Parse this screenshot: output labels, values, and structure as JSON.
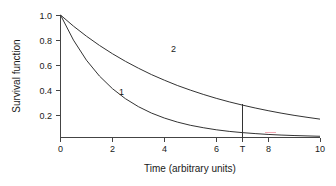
{
  "chart_data": {
    "type": "line",
    "title": "",
    "xlabel": "Time (arbitrary units)",
    "ylabel": "Survival function",
    "xlim": [
      0,
      10
    ],
    "ylim": [
      0,
      1.0
    ],
    "xticks": [
      0,
      2,
      4,
      6,
      8,
      10
    ],
    "xtick_labels": [
      "0",
      "2",
      "4",
      "6",
      "8",
      "10"
    ],
    "yticks": [
      0.2,
      0.4,
      0.6,
      0.8,
      1.0
    ],
    "ytick_labels": [
      "0.2",
      "0.4",
      "0.6",
      "0.8",
      "1.0"
    ],
    "grid": false,
    "legend": "none",
    "annotations": [
      {
        "name": "curve-1-label",
        "text": "1",
        "x": 2.35,
        "y": 0.345
      },
      {
        "name": "curve-2-label",
        "text": "2",
        "x": 4.35,
        "y": 0.695
      },
      {
        "name": "t-marker-label",
        "text": "T",
        "x": 7.0,
        "y": 0.0
      }
    ],
    "markers": [
      {
        "name": "t-vertical-line",
        "label": "T",
        "x": 7.0,
        "y_from": 0.0,
        "y_to": 0.27
      }
    ],
    "series": [
      {
        "name": "1",
        "label": "1",
        "color": "#333333",
        "x": [
          0,
          0.5,
          1,
          1.5,
          2,
          2.5,
          3,
          3.5,
          4,
          4.5,
          5,
          5.5,
          6,
          6.5,
          7,
          7.5,
          8,
          8.5,
          9,
          9.5,
          10
        ],
        "values": [
          1.0,
          0.795,
          0.631,
          0.502,
          0.399,
          0.317,
          0.252,
          0.2,
          0.159,
          0.126,
          0.1,
          0.08,
          0.063,
          0.05,
          0.04,
          0.032,
          0.025,
          0.02,
          0.016,
          0.013,
          0.01
        ]
      },
      {
        "name": "2",
        "label": "2",
        "color": "#333333",
        "x": [
          0,
          0.5,
          1,
          1.5,
          2,
          2.5,
          3,
          3.5,
          4,
          4.5,
          5,
          5.5,
          6,
          6.5,
          7,
          7.5,
          8,
          8.5,
          9,
          9.5,
          10
        ],
        "values": [
          1.0,
          0.909,
          0.827,
          0.752,
          0.684,
          0.622,
          0.566,
          0.514,
          0.468,
          0.425,
          0.387,
          0.352,
          0.32,
          0.291,
          0.265,
          0.241,
          0.219,
          0.199,
          0.181,
          0.165,
          0.15
        ]
      }
    ]
  },
  "figure": {
    "background": "#ffffff",
    "axis_color": "#444444",
    "curve_color": "#333333",
    "artifact_color": "#f2a8b4"
  }
}
